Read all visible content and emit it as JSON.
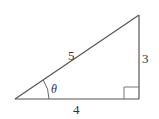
{
  "diagram": {
    "type": "right-triangle",
    "labels": {
      "hypotenuse": "5",
      "opposite": "3",
      "adjacent": "4",
      "angle": "θ"
    },
    "vertices": {
      "angle_vertex": [
        15,
        99
      ],
      "right_angle_vertex": [
        139,
        99
      ],
      "top_vertex": [
        139,
        15
      ]
    },
    "colors": {
      "stroke": "#555555",
      "text": "#333333",
      "background": "#ffffff"
    }
  }
}
